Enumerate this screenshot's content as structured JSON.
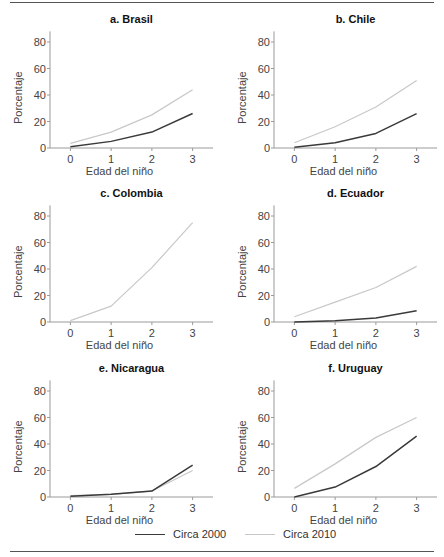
{
  "chart_data": [
    {
      "type": "line",
      "title": "a. Brasil",
      "xlabel": "Edad del niño",
      "ylabel": "Porcentaje",
      "x": [
        0,
        1,
        2,
        3
      ],
      "xticks": [
        "0",
        "1",
        "2",
        "3"
      ],
      "yticks": [
        "0",
        "20",
        "40",
        "60",
        "80"
      ],
      "xlim": [
        -0.5,
        3.5
      ],
      "ylim": [
        0,
        88
      ],
      "series": [
        {
          "name": "Circa 2000",
          "values": [
            1,
            5,
            12,
            26
          ]
        },
        {
          "name": "Circa 2010",
          "values": [
            3.5,
            12,
            25,
            44
          ]
        }
      ]
    },
    {
      "type": "line",
      "title": "b. Chile",
      "xlabel": "Edad del niño",
      "ylabel": "Porcentaje",
      "x": [
        0,
        1,
        2,
        3
      ],
      "xticks": [
        "0",
        "1",
        "2",
        "3"
      ],
      "yticks": [
        "0",
        "20",
        "40",
        "60",
        "80"
      ],
      "xlim": [
        -0.5,
        3.5
      ],
      "ylim": [
        0,
        88
      ],
      "series": [
        {
          "name": "Circa 2000",
          "values": [
            0.5,
            4,
            11,
            26
          ]
        },
        {
          "name": "Circa 2010",
          "values": [
            4,
            16,
            31,
            51
          ]
        }
      ]
    },
    {
      "type": "line",
      "title": "c. Colombia",
      "xlabel": "Edad del niño",
      "ylabel": "Porcentaje",
      "x": [
        0,
        1,
        2,
        3
      ],
      "xticks": [
        "0",
        "1",
        "2",
        "3"
      ],
      "yticks": [
        "0",
        "20",
        "40",
        "60",
        "80"
      ],
      "xlim": [
        -0.5,
        3.5
      ],
      "ylim": [
        0,
        88
      ],
      "series": [
        {
          "name": "Circa 2000",
          "values": [
            null,
            null,
            null,
            null
          ]
        },
        {
          "name": "Circa 2010",
          "values": [
            1,
            12,
            41,
            75
          ]
        }
      ]
    },
    {
      "type": "line",
      "title": "d. Ecuador",
      "xlabel": "Edad del niño",
      "ylabel": "Porcentaje",
      "x": [
        0,
        1,
        2,
        3
      ],
      "xticks": [
        "0",
        "1",
        "2",
        "3"
      ],
      "yticks": [
        "0",
        "20",
        "40",
        "60",
        "80"
      ],
      "xlim": [
        -0.5,
        3.5
      ],
      "ylim": [
        0,
        88
      ],
      "series": [
        {
          "name": "Circa 2000",
          "values": [
            0,
            1,
            3,
            8.5
          ]
        },
        {
          "name": "Circa 2010",
          "values": [
            4,
            15,
            26,
            42
          ]
        }
      ]
    },
    {
      "type": "line",
      "title": "e. Nicaragua",
      "xlabel": "Edad del niño",
      "ylabel": "Porcentaje",
      "x": [
        0,
        1,
        2,
        3
      ],
      "xticks": [
        "0",
        "1",
        "2",
        "3"
      ],
      "yticks": [
        "0",
        "20",
        "40",
        "60",
        "80"
      ],
      "xlim": [
        -0.5,
        3.5
      ],
      "ylim": [
        0,
        88
      ],
      "series": [
        {
          "name": "Circa 2000",
          "values": [
            0.5,
            2,
            4.5,
            24
          ]
        },
        {
          "name": "Circa 2010",
          "values": [
            1,
            2,
            4.5,
            20
          ]
        }
      ]
    },
    {
      "type": "line",
      "title": "f. Uruguay",
      "xlabel": "Edad del niño",
      "ylabel": "Porcentaje",
      "x": [
        0,
        1,
        2,
        3
      ],
      "xticks": [
        "0",
        "1",
        "2",
        "3"
      ],
      "yticks": [
        "0",
        "20",
        "40",
        "60",
        "80"
      ],
      "xlim": [
        -0.5,
        3.5
      ],
      "ylim": [
        0,
        88
      ],
      "series": [
        {
          "name": "Circa 2000",
          "values": [
            0,
            7.5,
            23,
            46
          ]
        },
        {
          "name": "Circa 2010",
          "values": [
            6.5,
            25,
            45,
            60
          ]
        }
      ]
    }
  ],
  "legend": {
    "placement": "bottom-center",
    "items": [
      {
        "label": "Circa 2000",
        "color": "#3a3a3a"
      },
      {
        "label": "Circa 2010",
        "color": "#c8c8c8"
      }
    ]
  },
  "colors": {
    "series_2000": "#3a3a3a",
    "series_2010": "#c8c8c8",
    "axis": "#9a9a9a",
    "rule": "#555555"
  }
}
